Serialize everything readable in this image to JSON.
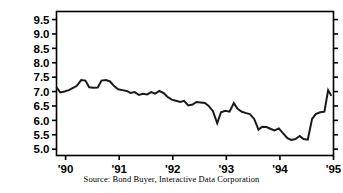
{
  "figure": {
    "source_note": "Source: Bond Buyer, Interactive Data Corporation",
    "line_color": "#1a1a1a",
    "axis_color": "#000000",
    "background_color": "#ffffff"
  },
  "chart_data": {
    "type": "line",
    "title": "",
    "subtitle": "",
    "xlabel": "",
    "ylabel": "",
    "grid": false,
    "legend": null,
    "xlim": [
      1989.83,
      1995.0
    ],
    "ylim": [
      4.78,
      9.78
    ],
    "yticks": [
      5.0,
      5.5,
      6.0,
      6.5,
      7.0,
      7.5,
      8.0,
      8.5,
      9.0,
      9.5
    ],
    "ytick_labels": [
      "5.0",
      "5.5",
      "6.0",
      "6.5",
      "7.0",
      "7.5",
      "8.0",
      "8.5",
      "9.0",
      "9.5"
    ],
    "xticks": [
      1990,
      1991,
      1992,
      1993,
      1994,
      1995
    ],
    "xtick_labels": [
      "'90",
      "'91",
      "'92",
      "'93",
      "'94",
      "'95"
    ],
    "series": [
      {
        "name": "Bond Buyer municipal bond yield index",
        "x": [
          1989.83,
          1989.9,
          1989.98,
          1990.06,
          1990.14,
          1990.21,
          1990.29,
          1990.37,
          1990.44,
          1990.52,
          1990.6,
          1990.67,
          1990.75,
          1990.83,
          1990.9,
          1990.98,
          1991.06,
          1991.14,
          1991.21,
          1991.29,
          1991.37,
          1991.44,
          1991.52,
          1991.6,
          1991.67,
          1991.75,
          1991.83,
          1991.9,
          1991.98,
          1992.06,
          1992.14,
          1992.21,
          1992.29,
          1992.37,
          1992.44,
          1992.52,
          1992.6,
          1992.67,
          1992.75,
          1992.83,
          1992.9,
          1992.98,
          1993.06,
          1993.14,
          1993.21,
          1993.29,
          1993.37,
          1993.44,
          1993.52,
          1993.6,
          1993.67,
          1993.75,
          1993.83,
          1993.9,
          1993.98,
          1994.06,
          1994.14,
          1994.21,
          1994.29,
          1994.37,
          1994.44,
          1994.52,
          1994.6,
          1994.67,
          1994.75,
          1994.83,
          1994.9,
          1994.96
        ],
        "y": [
          7.15,
          6.97,
          7.0,
          7.05,
          7.13,
          7.2,
          7.4,
          7.38,
          7.15,
          7.13,
          7.14,
          7.38,
          7.4,
          7.35,
          7.2,
          7.08,
          7.05,
          7.02,
          6.95,
          6.98,
          6.88,
          6.92,
          6.9,
          6.98,
          6.93,
          7.02,
          6.95,
          6.82,
          6.72,
          6.68,
          6.64,
          6.68,
          6.52,
          6.55,
          6.64,
          6.62,
          6.6,
          6.5,
          6.32,
          5.9,
          6.28,
          6.33,
          6.3,
          6.6,
          6.4,
          6.3,
          6.25,
          6.22,
          6.05,
          5.68,
          5.78,
          5.77,
          5.7,
          5.65,
          5.72,
          5.55,
          5.38,
          5.32,
          5.35,
          5.46,
          5.35,
          5.33,
          6.05,
          6.22,
          6.28,
          6.3,
          7.05,
          6.85
        ]
      }
    ],
    "annotations": [
      "Source: Bond Buyer, Interactive Data Corporation"
    ]
  }
}
